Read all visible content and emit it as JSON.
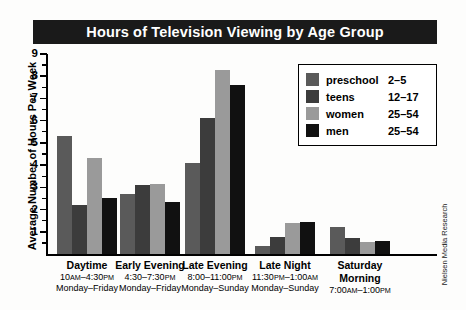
{
  "title": "Hours of Television Viewing by Age Group",
  "source_credit": "Nielsen Media Research",
  "axis": {
    "ylabel": "Average Number of Hours Per Week",
    "ytick_labels": [
      "9",
      "8",
      "7",
      "6",
      "5",
      "4",
      "3",
      "2",
      "1"
    ]
  },
  "legend": {
    "entries": [
      {
        "label": "preschool",
        "range": "2–5",
        "color": "#5a5a5a"
      },
      {
        "label": "teens",
        "range": "12–17",
        "color": "#3c3c3c"
      },
      {
        "label": "women",
        "range": "25–54",
        "color": "#9a9a9a"
      },
      {
        "label": "men",
        "range": "25–54",
        "color": "#111111"
      }
    ]
  },
  "categories": [
    {
      "name": "Daytime",
      "time_start": "10",
      "time_ampm1": "AM",
      "time_mid": "–4:30",
      "time_ampm2": "PM",
      "days": "Monday–Friday"
    },
    {
      "name": "Early Evening",
      "time_start": "4:30–7:30",
      "time_ampm1": "",
      "time_mid": "",
      "time_ampm2": "PM",
      "days": "Monday–Friday"
    },
    {
      "name": "Late Evening",
      "time_start": "8:00–11:00",
      "time_ampm1": "",
      "time_mid": "",
      "time_ampm2": "PM",
      "days": "Monday–Sunday"
    },
    {
      "name": "Late Night",
      "time_start": "11:30",
      "time_ampm1": "PM",
      "time_mid": "–1:00",
      "time_ampm2": "AM",
      "days": "Monday–Sunday"
    },
    {
      "name": "Saturday Morning",
      "time_start": "7:00",
      "time_ampm1": "AM",
      "time_mid": "–1:00",
      "time_ampm2": "PM",
      "days": ""
    }
  ],
  "chart_data": {
    "type": "bar",
    "title": "Hours of Television Viewing by Age Group",
    "xlabel": "",
    "ylabel": "Average Number of Hours Per Week",
    "ylim": [
      0,
      9
    ],
    "grid": false,
    "legend_position": "upper-right",
    "categories": [
      "Daytime",
      "Early Evening",
      "Late Evening",
      "Late Night",
      "Saturday Morning"
    ],
    "series": [
      {
        "name": "preschool",
        "age_range": "2–5",
        "color": "#5a5a5a",
        "values": [
          5.3,
          2.7,
          4.1,
          0.35,
          1.2
        ]
      },
      {
        "name": "teens",
        "age_range": "12–17",
        "color": "#3c3c3c",
        "values": [
          2.2,
          3.1,
          6.1,
          0.75,
          0.7
        ]
      },
      {
        "name": "women",
        "age_range": "25–54",
        "color": "#9a9a9a",
        "values": [
          4.3,
          3.15,
          8.3,
          1.4,
          0.55
        ]
      },
      {
        "name": "men",
        "age_range": "25–54",
        "color": "#111111",
        "values": [
          2.5,
          2.35,
          7.6,
          1.45,
          0.6
        ]
      }
    ]
  }
}
